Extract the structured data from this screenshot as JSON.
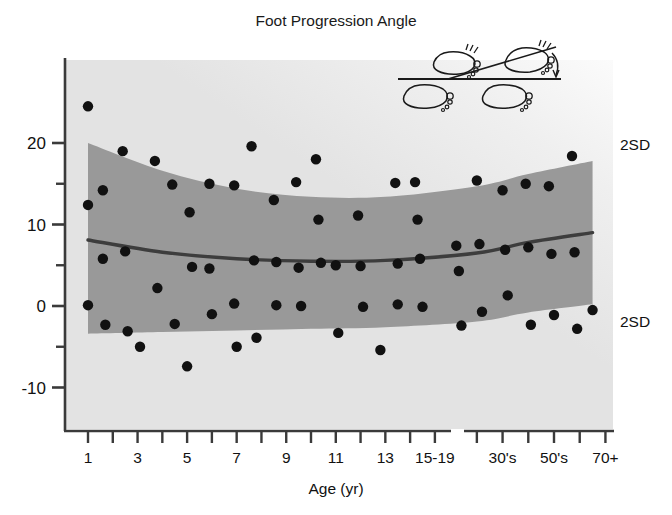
{
  "figure": {
    "title": "Foot Progression Angle",
    "background_color": "#ffffff",
    "plot_background_color": "#e2e2e2",
    "band_color": "#999999",
    "mean_line_color": "#3d3d3d",
    "point_color": "#111111",
    "axis_color": "#3a3a3a"
  },
  "annotations": {
    "sd_upper_label": "2SD",
    "sd_lower_label": "2SD",
    "diagram_name": "foot-progression-angle-diagram"
  },
  "chart_data": {
    "type": "scatter",
    "title": "Foot Progression Angle",
    "xlabel": "Age (yr)",
    "ylabel": "",
    "ylim": [
      -10,
      25
    ],
    "yticks": [
      -10,
      0,
      10,
      20
    ],
    "yticklabels": [
      "-10",
      "0",
      "10",
      "20"
    ],
    "yminorticks": [
      -5,
      5,
      15
    ],
    "grid": false,
    "legend": false,
    "axis_break": true,
    "x_categories": [
      "1",
      "2",
      "3",
      "4",
      "5",
      "6",
      "7",
      "8",
      "9",
      "10",
      "11",
      "12",
      "13",
      "14",
      "15-19",
      "20's",
      "30's",
      "40's",
      "50's",
      "60's",
      "70+"
    ],
    "xticklabels_shown": [
      "1",
      "3",
      "5",
      "7",
      "9",
      "11",
      "13",
      "15-19",
      "30's",
      "50's",
      "70+"
    ],
    "series": [
      {
        "name": "Subjects",
        "points": [
          {
            "x": 1,
            "y": 24.5
          },
          {
            "x": 1,
            "y": 12.4
          },
          {
            "x": 1,
            "y": 0.1
          },
          {
            "x": 1.6,
            "y": 14.2
          },
          {
            "x": 1.6,
            "y": 5.8
          },
          {
            "x": 1.7,
            "y": -2.3
          },
          {
            "x": 2.4,
            "y": 19.0
          },
          {
            "x": 2.5,
            "y": 6.7
          },
          {
            "x": 2.6,
            "y": -3.1
          },
          {
            "x": 3.1,
            "y": -5.0
          },
          {
            "x": 3.7,
            "y": 17.8
          },
          {
            "x": 3.8,
            "y": 2.2
          },
          {
            "x": 4.4,
            "y": 14.9
          },
          {
            "x": 4.5,
            "y": -2.2
          },
          {
            "x": 5.0,
            "y": -7.4
          },
          {
            "x": 5.1,
            "y": 11.5
          },
          {
            "x": 5.2,
            "y": 4.8
          },
          {
            "x": 5.9,
            "y": 15.0
          },
          {
            "x": 5.9,
            "y": 4.6
          },
          {
            "x": 6.0,
            "y": -1.0
          },
          {
            "x": 6.9,
            "y": 14.8
          },
          {
            "x": 6.9,
            "y": 0.3
          },
          {
            "x": 7.0,
            "y": -5.0
          },
          {
            "x": 7.6,
            "y": 19.6
          },
          {
            "x": 7.7,
            "y": 5.6
          },
          {
            "x": 7.8,
            "y": -3.9
          },
          {
            "x": 8.5,
            "y": 13.0
          },
          {
            "x": 8.6,
            "y": 5.4
          },
          {
            "x": 8.6,
            "y": 0.1
          },
          {
            "x": 9.4,
            "y": 15.2
          },
          {
            "x": 9.5,
            "y": 4.7
          },
          {
            "x": 9.6,
            "y": 0.0
          },
          {
            "x": 10.2,
            "y": 18.0
          },
          {
            "x": 10.3,
            "y": 10.6
          },
          {
            "x": 10.4,
            "y": 5.3
          },
          {
            "x": 11.0,
            "y": 5.0
          },
          {
            "x": 11.1,
            "y": -3.3
          },
          {
            "x": 11.9,
            "y": 11.1
          },
          {
            "x": 12.0,
            "y": 4.9
          },
          {
            "x": 12.1,
            "y": -0.1
          },
          {
            "x": 12.8,
            "y": -5.4
          },
          {
            "x": 13.4,
            "y": 15.1
          },
          {
            "x": 13.5,
            "y": 5.2
          },
          {
            "x": 13.5,
            "y": 0.2
          },
          {
            "x": 14.2,
            "y": 15.2
          },
          {
            "x": 14.3,
            "y": 10.6
          },
          {
            "x": 14.4,
            "y": 5.8
          },
          {
            "x": 14.5,
            "y": -0.1
          },
          {
            "x": 15.2,
            "y": 7.4
          },
          {
            "x": 15.3,
            "y": 4.3
          },
          {
            "x": 15.4,
            "y": -2.4
          },
          {
            "x": 16.0,
            "y": 15.4
          },
          {
            "x": 16.1,
            "y": 7.6
          },
          {
            "x": 16.2,
            "y": -0.7
          },
          {
            "x": 17.0,
            "y": 14.2
          },
          {
            "x": 17.1,
            "y": 6.9
          },
          {
            "x": 17.2,
            "y": 1.3
          },
          {
            "x": 17.9,
            "y": 15.0
          },
          {
            "x": 18.0,
            "y": 7.2
          },
          {
            "x": 18.1,
            "y": -2.3
          },
          {
            "x": 18.8,
            "y": 14.7
          },
          {
            "x": 18.9,
            "y": 6.4
          },
          {
            "x": 19.0,
            "y": -1.1
          },
          {
            "x": 19.7,
            "y": 18.4
          },
          {
            "x": 19.8,
            "y": 6.6
          },
          {
            "x": 19.9,
            "y": -2.8
          },
          {
            "x": 20.5,
            "y": -0.5
          }
        ]
      }
    ],
    "mean_curve": {
      "name": "Mean",
      "description": "Smooth mean of foot progression angle vs age",
      "values": [
        {
          "x": 1,
          "y": 8.1
        },
        {
          "x": 4,
          "y": 6.6
        },
        {
          "x": 7,
          "y": 5.8
        },
        {
          "x": 10,
          "y": 5.5
        },
        {
          "x": 13,
          "y": 5.6
        },
        {
          "x": 16,
          "y": 6.5
        },
        {
          "x": 18,
          "y": 7.8
        },
        {
          "x": 20.5,
          "y": 9.0
        }
      ]
    },
    "band_upper_2sd": {
      "name": "+2SD",
      "values": [
        {
          "x": 1,
          "y": 20.0
        },
        {
          "x": 4,
          "y": 16.6
        },
        {
          "x": 7,
          "y": 14.4
        },
        {
          "x": 10,
          "y": 13.4
        },
        {
          "x": 13,
          "y": 13.4
        },
        {
          "x": 16,
          "y": 14.7
        },
        {
          "x": 18,
          "y": 16.2
        },
        {
          "x": 20.5,
          "y": 17.8
        }
      ]
    },
    "band_lower_2sd": {
      "name": "-2SD",
      "values": [
        {
          "x": 1,
          "y": -3.4
        },
        {
          "x": 4,
          "y": -3.2
        },
        {
          "x": 7,
          "y": -3.0
        },
        {
          "x": 10,
          "y": -2.8
        },
        {
          "x": 13,
          "y": -2.6
        },
        {
          "x": 16,
          "y": -1.9
        },
        {
          "x": 18,
          "y": -0.8
        },
        {
          "x": 20.5,
          "y": 0.2
        }
      ]
    }
  }
}
